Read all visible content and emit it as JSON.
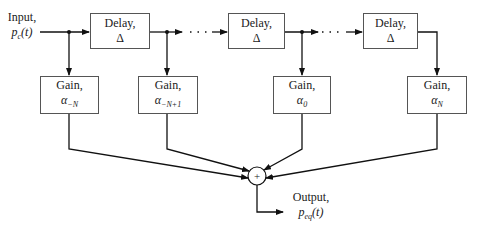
{
  "input": {
    "label": "Input,",
    "symbol": "p",
    "subscript": "c",
    "arg": "(t)"
  },
  "output": {
    "label": "Output,",
    "symbol": "p",
    "subscript": "eq",
    "arg": "(t)"
  },
  "delays": [
    {
      "label": "Delay,",
      "symbol": "Δ"
    },
    {
      "label": "Delay,",
      "symbol": "Δ"
    },
    {
      "label": "Delay,",
      "symbol": "Δ"
    }
  ],
  "gains": [
    {
      "label": "Gain,",
      "symbol": "α",
      "subscript": "−N"
    },
    {
      "label": "Gain,",
      "symbol": "α",
      "subscript": "−N+1"
    },
    {
      "label": "Gain,",
      "symbol": "α",
      "subscript": "0"
    },
    {
      "label": "Gain,",
      "symbol": "α",
      "subscript": "N"
    }
  ],
  "summer": {
    "symbol": "+"
  },
  "continuation": "· · ·"
}
